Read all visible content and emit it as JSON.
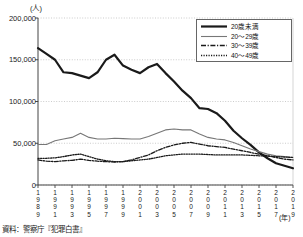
{
  "chart_data": {
    "type": "line",
    "title": "",
    "xlabel": "(年)",
    "ylabel": "(人)",
    "ylim": [
      0,
      200000
    ],
    "xlim": [
      1989,
      2019
    ],
    "grid": true,
    "legend_position": "top-right",
    "ytick_labels": [
      "200,000",
      "150,000",
      "100,000",
      "50,000",
      "0"
    ],
    "ytick_values": [
      200000,
      150000,
      100000,
      50000,
      0
    ],
    "xtick_labels": [
      "1989",
      "1991",
      "1993",
      "1995",
      "1997",
      "1999",
      "2001",
      "2003",
      "2005",
      "2007",
      "2009",
      "2011",
      "2013",
      "2015",
      "2017",
      "2019"
    ],
    "x": [
      1989,
      1990,
      1991,
      1992,
      1993,
      1994,
      1995,
      1996,
      1997,
      1998,
      1999,
      2000,
      2001,
      2002,
      2003,
      2004,
      2005,
      2006,
      2007,
      2008,
      2009,
      2010,
      2011,
      2012,
      2013,
      2014,
      2015,
      2016,
      2017,
      2018,
      2019
    ],
    "series": [
      {
        "name": "20歳未満",
        "style": "solid-thick",
        "color": "#1a1a1a",
        "values": [
          164000,
          157000,
          150000,
          135000,
          134000,
          131000,
          128000,
          135000,
          150000,
          156000,
          143000,
          138000,
          134000,
          141000,
          145000,
          134000,
          124000,
          113000,
          104000,
          92000,
          91000,
          86000,
          77000,
          65000,
          56000,
          48000,
          39000,
          32000,
          26000,
          23000,
          20000
        ]
      },
      {
        "name": "20～29歳",
        "style": "solid-thin",
        "color": "#777777",
        "values": [
          48500,
          48500,
          53000,
          55000,
          57000,
          62000,
          57000,
          55000,
          55000,
          56000,
          55500,
          55000,
          55000,
          58000,
          62000,
          66000,
          67000,
          66000,
          66000,
          61000,
          57000,
          55000,
          54000,
          51000,
          47000,
          43000,
          40000,
          37000,
          35000,
          34000,
          33000
        ]
      },
      {
        "name": "30～39歳",
        "style": "dashdot",
        "color": "#1a1a1a",
        "values": [
          30000,
          28500,
          28000,
          29000,
          29500,
          31000,
          29500,
          28500,
          28000,
          27500,
          28000,
          30000,
          33000,
          36000,
          41000,
          45000,
          48000,
          50000,
          51000,
          49000,
          47000,
          46000,
          45000,
          43000,
          41000,
          39000,
          37000,
          35000,
          33000,
          31000,
          30000
        ]
      },
      {
        "name": "40～49歳",
        "style": "dotted",
        "color": "#1a1a1a",
        "values": [
          32000,
          32000,
          32500,
          34000,
          36000,
          37000,
          34000,
          31000,
          29000,
          28000,
          28000,
          29000,
          30000,
          31000,
          33000,
          35000,
          36000,
          37000,
          37000,
          37000,
          36500,
          36000,
          36000,
          36000,
          36000,
          35500,
          35000,
          34500,
          34000,
          33500,
          33000
        ]
      }
    ]
  },
  "source_note": "資料：警察庁『犯罪白書』",
  "axis": {
    "y_unit": "(人)",
    "x_unit": "(年)"
  }
}
